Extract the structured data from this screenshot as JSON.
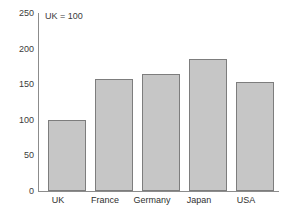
{
  "chart_data": {
    "type": "bar",
    "title": "countries",
    "subtitle": "",
    "xlabel": "",
    "ylabel": "",
    "categories": [
      "UK",
      "France",
      "Germany",
      "Japan",
      "USA"
    ],
    "values": [
      100,
      157,
      165,
      186,
      153
    ],
    "series": [
      {
        "name": "Index",
        "values": [
          100,
          157,
          165,
          186,
          153
        ]
      }
    ],
    "ylim": [
      0,
      250
    ],
    "yticks": [
      0,
      50,
      100,
      150,
      200,
      250
    ],
    "ytick_labels": [
      "0",
      "50",
      "100",
      "150",
      "200",
      "250"
    ],
    "grid": false,
    "legend": null,
    "annotations": [
      {
        "name": "baseline-note",
        "text": "UK = 100"
      }
    ],
    "colors": {
      "bar_fill": "#c6c6c6",
      "bar_border": "#7d7d7d",
      "axis": "#8c8c8c",
      "text": "#333333",
      "background": "#ffffff"
    }
  }
}
